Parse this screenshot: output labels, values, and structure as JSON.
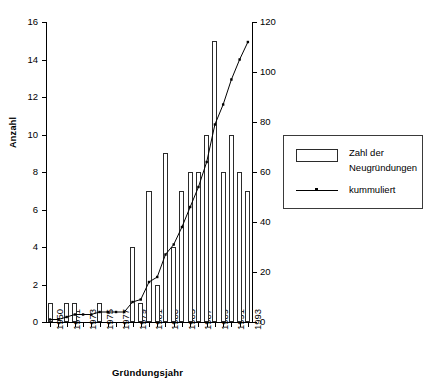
{
  "chart_data": {
    "type": "bar",
    "title": "",
    "xlabel": "Gründungsjahr",
    "ylabel": "Anzahl",
    "ylabel_right": "",
    "grid": false,
    "ylim": [
      0,
      16
    ],
    "ylim_right": [
      0,
      120
    ],
    "yticks": [
      0,
      2,
      4,
      6,
      8,
      10,
      12,
      14,
      16
    ],
    "yticks_right": [
      0,
      20,
      40,
      60,
      80,
      100,
      120
    ],
    "legend_position": "right",
    "categories": [
      "1950",
      "1970",
      "1971",
      "1972",
      "1973",
      "1974",
      "1975",
      "1976",
      "1977",
      "1978",
      "1979",
      "1980",
      "1981",
      "1982",
      "1983",
      "1984",
      "1985",
      "1986",
      "1987",
      "1988",
      "1989",
      "1990",
      "1991",
      "1992",
      "1993"
    ],
    "xtick_labels": [
      "1950",
      "1971",
      "1973",
      "1975",
      "1977",
      "1979",
      "1981",
      "1983",
      "1985",
      "1987",
      "1989",
      "1991",
      "1993"
    ],
    "series": [
      {
        "name": "Zahl der Neugründungen",
        "type": "bar",
        "values": [
          1,
          0,
          1,
          1,
          0,
          0,
          1,
          0,
          0,
          0,
          4,
          1,
          7,
          2,
          9,
          4,
          7,
          8,
          8,
          10,
          15,
          8,
          10,
          8,
          7
        ]
      },
      {
        "name": "kummuliert",
        "type": "line",
        "axis": "right",
        "values": [
          1,
          1,
          2,
          3,
          3,
          3,
          4,
          4,
          4,
          4,
          8,
          9,
          16,
          18,
          27,
          31,
          38,
          46,
          54,
          64,
          79,
          87,
          97,
          105,
          112
        ]
      }
    ],
    "legend": [
      {
        "label_line1": "Zahl der",
        "label_line2": "Neugründungen",
        "marker": "bar-swatch"
      },
      {
        "label_line1": "kummuliert",
        "label_line2": "",
        "marker": "line-marker"
      }
    ],
    "colors": {
      "bar_stroke": "#2b2b2b",
      "bar_fill": "#ffffff",
      "line": "#000000",
      "axis": "#000000"
    }
  }
}
